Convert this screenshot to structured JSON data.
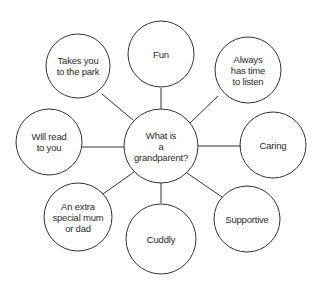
{
  "diagram": {
    "type": "spider",
    "center": {
      "label": "What is a grandparent?",
      "lines": [
        "What is",
        "a",
        "grandparent?"
      ]
    },
    "spokes": [
      {
        "id": "fun",
        "lines": [
          "Fun"
        ]
      },
      {
        "id": "always",
        "lines": [
          "Always",
          "has time",
          "to listen"
        ]
      },
      {
        "id": "caring",
        "lines": [
          "Caring"
        ]
      },
      {
        "id": "supportive",
        "lines": [
          "Supportive"
        ]
      },
      {
        "id": "cuddly",
        "lines": [
          "Cuddly"
        ]
      },
      {
        "id": "extra",
        "lines": [
          "An extra",
          "special mum",
          "or dad"
        ]
      },
      {
        "id": "read",
        "lines": [
          "Will read",
          "to you"
        ]
      },
      {
        "id": "park",
        "lines": [
          "Takes you",
          "to the park"
        ]
      }
    ],
    "colors": {
      "stroke": "#333333",
      "text": "#2b2b2b",
      "background": "#ffffff"
    }
  }
}
